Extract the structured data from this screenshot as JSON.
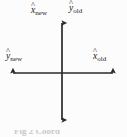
{
  "figure": {
    "background_color": "#fcfcfc",
    "line_color": "#2b2b2b",
    "text_color": "#1a1a1a",
    "width": 127,
    "height": 137
  },
  "axes": {
    "origin": {
      "x": 62,
      "y": 73
    },
    "vertical": {
      "top_tip_y": 21,
      "bottom_tip_y": 122,
      "x": 62,
      "double_headed": true
    },
    "horizontal": {
      "left_tip_x": 11,
      "right_tip_x": 115,
      "y": 73,
      "double_headed": true
    }
  },
  "labels": {
    "up": {
      "symbol": "x",
      "hat": "^",
      "subscript": "new",
      "position": "top-left-of-vertical-axis"
    },
    "up_right": {
      "symbol": "y",
      "hat": "^",
      "subscript": "old",
      "position": "top-right-of-vertical-axis"
    },
    "left": {
      "symbol": "y",
      "hat": "^",
      "subscript": "new",
      "position": "left-end-of-horizontal-axis"
    },
    "right": {
      "symbol": "x",
      "hat": "^",
      "subscript": "old",
      "position": "right-end-of-horizontal-axis"
    }
  },
  "caption": {
    "text": "Fig 2  Coord"
  }
}
